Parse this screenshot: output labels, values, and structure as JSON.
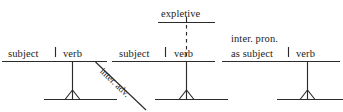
{
  "figure": {
    "kind": "reed-kellogg-sentence-diagram-set",
    "stroke_color": "#2b2b2b",
    "text_color": "#1c1c1c",
    "background": "#ffffff",
    "width": 343,
    "height": 112
  },
  "diagrams": [
    {
      "id": "diagram-1",
      "name": "subject-verb-with-interrogative-adverb",
      "labels": {
        "subject": "subject",
        "verb": "verb",
        "modifier": "inter. adv."
      }
    },
    {
      "id": "diagram-2",
      "name": "subject-verb-with-expletive",
      "labels": {
        "expletive": "expletive",
        "subject": "subject",
        "verb": "verb"
      }
    },
    {
      "id": "diagram-3",
      "name": "interrogative-pronoun-as-subject-verb",
      "labels": {
        "subject_line1": "inter. pron.",
        "subject_line2": "as subject",
        "verb": "verb"
      }
    }
  ]
}
